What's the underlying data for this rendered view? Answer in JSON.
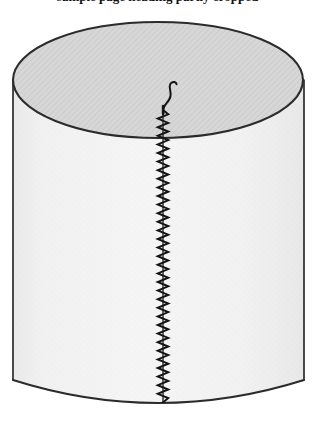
{
  "image": {
    "width": 315,
    "height": 424,
    "background_color": "#ffffff",
    "kind": "line-drawing-illustration"
  },
  "caption": {
    "text": "sample page heading partly cropped",
    "visible_portion": "bottom descenders only (clipped at top frame edge)"
  },
  "figure": {
    "stroke_color": "#2b2b2b",
    "top_face": {
      "name": "top ellipse",
      "fill_color": "#d6d6d6",
      "hatch_color": "#bdbdbd",
      "center_x": 158,
      "center_y": 80,
      "radius_x": 145,
      "radius_y": 58,
      "apex_y": 22
    },
    "body": {
      "name": "cylinder side wall",
      "fill_color": "#f2f2f2",
      "left_x": 13,
      "right_x": 304,
      "top_y": 80,
      "bottom_y": 380,
      "bottom_arc_depth": 23
    },
    "seam": {
      "name": "zigzag stitched seam",
      "thread_color": "#1a1a1a",
      "center_x": 163,
      "start_y": 110,
      "end_y": 402,
      "stitch_count": 34,
      "stitch_amplitude_px": 5,
      "stitch_pitch_px": 8.6
    },
    "thread_tail": {
      "name": "loose thread end",
      "thread_color": "#1a1a1a",
      "start_x": 163,
      "start_y": 112,
      "end_x": 176,
      "end_y": 82,
      "shape": "S-curve rising and curling to the right"
    },
    "top_seam_mark": {
      "name": "seam tick on top rim",
      "x": 163,
      "y1": 108,
      "y2": 114
    }
  }
}
